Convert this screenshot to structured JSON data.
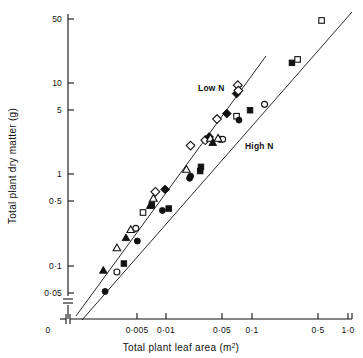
{
  "figure": {
    "background": "#ffffff",
    "ink": "#111111"
  },
  "chart_data": {
    "type": "scatter",
    "title": "",
    "xlabel": "Total plant leaf area (m",
    "xlabel_sup": "2",
    "xlabel_tail": ")",
    "ylabel": "Total plant dry matter (g)",
    "xscale": "log",
    "yscale": "log",
    "xlim": [
      0.0015,
      1.0
    ],
    "ylim": [
      0.04,
      60
    ],
    "grid": false,
    "legend_position": "inline-annotations",
    "axis_break_x": true,
    "axis_break_y": true,
    "xticks": [
      {
        "label": "0",
        "value": 0,
        "px": 48,
        "tickmark": false
      },
      {
        "label": "0·005",
        "value": 0.005,
        "px": 137,
        "tickmark": true
      },
      {
        "label": "0·01",
        "value": 0.01,
        "px": 166,
        "tickmark": true
      },
      {
        "label": "0·05",
        "value": 0.05,
        "px": 222,
        "tickmark": true
      },
      {
        "label": "0·1",
        "value": 0.1,
        "px": 252,
        "tickmark": true
      },
      {
        "label": "0·5",
        "value": 0.5,
        "px": 318,
        "tickmark": true
      },
      {
        "label": "1·0",
        "value": 1.0,
        "px": 348,
        "tickmark": true
      }
    ],
    "yticks": [
      {
        "label": "50",
        "value": 50,
        "px": 19
      },
      {
        "label": "10",
        "value": 10,
        "px": 83
      },
      {
        "label": "5",
        "value": 5,
        "px": 110
      },
      {
        "label": "1",
        "value": 1,
        "px": 174
      },
      {
        "label": "0·5",
        "value": 0.5,
        "px": 201
      },
      {
        "label": "0·1",
        "value": 0.1,
        "px": 266
      },
      {
        "label": "0·05",
        "value": 0.05,
        "px": 293
      }
    ],
    "annotations": [
      {
        "text": "Low N",
        "x_px": 198,
        "y_px": 91,
        "name": "low-n-label"
      },
      {
        "text": "High N",
        "x_px": 245,
        "y_px": 149,
        "name": "high-n-label"
      }
    ],
    "trend_lines": [
      {
        "name": "low-n-regression",
        "x1_px": 76,
        "y1_px": 316,
        "x2_px": 266,
        "y2_px": 56
      },
      {
        "name": "high-n-regression",
        "x1_px": 82,
        "y1_px": 320,
        "x2_px": 352,
        "y2_px": 12
      }
    ],
    "series": [
      {
        "name": "Low N",
        "marker_note": "open and filled triangles, diamonds, squares, circles on upper regression line",
        "points": [
          {
            "x": 0.0022,
            "y": 0.088,
            "marker": "filled-triangle"
          },
          {
            "x": 0.0031,
            "y": 0.155,
            "marker": "open-triangle"
          },
          {
            "x": 0.0039,
            "y": 0.2,
            "marker": "filled-triangle"
          },
          {
            "x": 0.0044,
            "y": 0.245,
            "marker": "open-triangle"
          },
          {
            "x": 0.005,
            "y": 0.255,
            "marker": "open-circle"
          },
          {
            "x": 0.006,
            "y": 0.38,
            "marker": "open-square"
          },
          {
            "x": 0.0072,
            "y": 0.45,
            "marker": "filled-triangle"
          },
          {
            "x": 0.0075,
            "y": 0.46,
            "marker": "filled-square"
          },
          {
            "x": 0.0082,
            "y": 0.64,
            "marker": "open-diamond"
          },
          {
            "x": 0.0078,
            "y": 0.54,
            "marker": "open-triangle"
          },
          {
            "x": 0.018,
            "y": 1.12,
            "marker": "open-triangle"
          },
          {
            "x": 0.02,
            "y": 2.05,
            "marker": "open-diamond"
          },
          {
            "x": 0.029,
            "y": 2.35,
            "marker": "open-diamond"
          },
          {
            "x": 0.032,
            "y": 2.55,
            "marker": "filled-diamond"
          },
          {
            "x": 0.033,
            "y": 2.45,
            "marker": "open-triangle"
          },
          {
            "x": 0.035,
            "y": 2.2,
            "marker": "filled-triangle"
          },
          {
            "x": 0.039,
            "y": 4.0,
            "marker": "open-diamond"
          },
          {
            "x": 0.05,
            "y": 4.6,
            "marker": "filled-diamond"
          },
          {
            "x": 0.064,
            "y": 7.6,
            "marker": "filled-diamond"
          },
          {
            "x": 0.066,
            "y": 9.4,
            "marker": "open-diamond"
          },
          {
            "x": 0.067,
            "y": 8.2,
            "marker": "open-diamond"
          }
        ]
      },
      {
        "name": "High N",
        "marker_note": "filled circles and squares, open circles and squares on lower regression line",
        "points": [
          {
            "x": 0.0023,
            "y": 0.052,
            "marker": "filled-circle"
          },
          {
            "x": 0.0031,
            "y": 0.085,
            "marker": "open-circle"
          },
          {
            "x": 0.0037,
            "y": 0.105,
            "marker": "filled-square"
          },
          {
            "x": 0.0052,
            "y": 0.185,
            "marker": "filled-circle"
          },
          {
            "x": 0.0098,
            "y": 0.4,
            "marker": "filled-circle"
          },
          {
            "x": 0.0115,
            "y": 0.42,
            "marker": "filled-square"
          },
          {
            "x": 0.0105,
            "y": 0.68,
            "marker": "filled-diamond"
          },
          {
            "x": 0.0195,
            "y": 0.9,
            "marker": "filled-circle"
          },
          {
            "x": 0.02,
            "y": 0.95,
            "marker": "filled-circle"
          },
          {
            "x": 0.0255,
            "y": 1.08,
            "marker": "filled-square"
          },
          {
            "x": 0.026,
            "y": 1.2,
            "marker": "filled-square"
          },
          {
            "x": 0.042,
            "y": 2.4,
            "marker": "open-circle"
          },
          {
            "x": 0.045,
            "y": 2.4,
            "marker": "open-circle"
          },
          {
            "x": 0.04,
            "y": 2.45,
            "marker": "open-triangle"
          },
          {
            "x": 0.064,
            "y": 4.3,
            "marker": "open-square"
          },
          {
            "x": 0.068,
            "y": 3.9,
            "marker": "filled-circle"
          },
          {
            "x": 0.09,
            "y": 5.0,
            "marker": "filled-square"
          },
          {
            "x": 0.13,
            "y": 5.8,
            "marker": "open-circle"
          },
          {
            "x": 0.26,
            "y": 16.5,
            "marker": "filled-square"
          },
          {
            "x": 0.3,
            "y": 18.0,
            "marker": "open-square"
          },
          {
            "x": 0.55,
            "y": 48.0,
            "marker": "open-square"
          }
        ]
      }
    ]
  }
}
